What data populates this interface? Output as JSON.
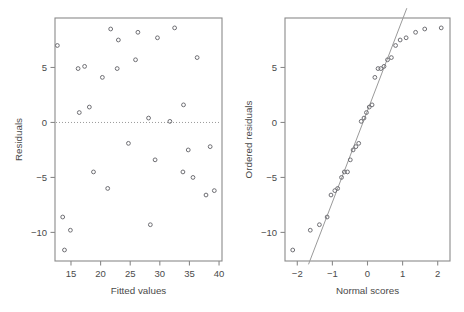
{
  "figure": {
    "width": 464,
    "height": 312,
    "background": "#ffffff",
    "point_color": "#6e6e73",
    "axis_color": "#8a8a8a",
    "line_color": "#9a9a9a"
  },
  "chart_data": [
    {
      "type": "scatter",
      "name": "residuals-vs-fitted",
      "title": "",
      "xlabel": "Fitted values",
      "ylabel": "Residuals",
      "xlim": [
        12.3,
        40.5
      ],
      "ylim": [
        -12.6,
        9.5
      ],
      "xticks": [
        15,
        20,
        25,
        30,
        35,
        40
      ],
      "yticks": [
        5,
        0,
        -5,
        -10
      ],
      "xticklabels": [
        "15",
        "20",
        "25",
        "30",
        "35",
        "40"
      ],
      "yticklabels": [
        "5",
        "0",
        "-5",
        "-10"
      ],
      "grid": false,
      "legend": "none",
      "reference_line": {
        "type": "horizontal",
        "y": 0,
        "style": "dotted"
      },
      "x": [
        12.7,
        13.6,
        14.9,
        16.2,
        16.4,
        17.3,
        18.1,
        18.8,
        20.3,
        21.2,
        21.7,
        22.8,
        23.0,
        24.7,
        25.9,
        26.3,
        28.1,
        28.4,
        29.2,
        29.6,
        31.7,
        32.5,
        33.9,
        34.0,
        34.8,
        35.6,
        36.3,
        37.8,
        38.5,
        39.2
      ],
      "y": [
        7.0,
        -8.6,
        -9.8,
        4.9,
        0.9,
        5.1,
        1.4,
        -4.5,
        4.1,
        -6.0,
        8.5,
        4.9,
        7.5,
        -1.9,
        5.7,
        8.2,
        0.4,
        -9.3,
        -3.4,
        7.7,
        0.1,
        8.6,
        -4.5,
        1.6,
        -2.5,
        -5.0,
        5.9,
        -6.6,
        -2.2,
        -6.2
      ],
      "y_extra": [
        -11.6
      ],
      "x_extra": [
        13.9
      ]
    },
    {
      "type": "scatter",
      "name": "normal-qq",
      "title": "",
      "xlabel": "Normal scores",
      "ylabel": "Ordered residuals",
      "xlim": [
        -2.35,
        2.35
      ],
      "ylim": [
        -12.6,
        9.5
      ],
      "xticks": [
        -2,
        -1,
        0,
        1,
        2
      ],
      "yticks": [
        5,
        0,
        -5,
        -10
      ],
      "xticklabels": [
        "-2",
        "-1",
        "0",
        "1",
        "2"
      ],
      "yticklabels": [
        "5",
        "0",
        "-5",
        "-10"
      ],
      "grid": false,
      "legend": "none",
      "fit_line": {
        "style": "solid",
        "x_from": -1.68,
        "x_to": 1.12
      },
      "x": [
        -2.13,
        -1.63,
        -1.37,
        -1.15,
        -1.04,
        -0.93,
        -0.85,
        -0.74,
        -0.66,
        -0.57,
        -0.49,
        -0.41,
        -0.33,
        -0.25,
        -0.18,
        -0.1,
        -0.03,
        0.05,
        0.13,
        0.21,
        0.3,
        0.38,
        0.47,
        0.57,
        0.68,
        0.8,
        0.93,
        1.1,
        1.37,
        1.63,
        2.1
      ],
      "y": [
        -11.6,
        -9.8,
        -9.3,
        -8.6,
        -6.6,
        -6.2,
        -6.0,
        -5.0,
        -4.5,
        -4.5,
        -3.4,
        -2.5,
        -2.2,
        -1.9,
        0.1,
        0.4,
        0.9,
        1.4,
        1.6,
        4.1,
        4.9,
        4.9,
        5.1,
        5.7,
        5.9,
        7.0,
        7.5,
        7.7,
        8.2,
        8.5,
        8.6
      ]
    }
  ]
}
